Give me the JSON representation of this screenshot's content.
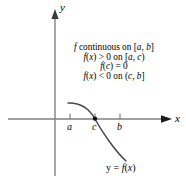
{
  "figure": {
    "title_alt": "Graph of a continuous function f on [a, b] crossing the x-axis at c",
    "background_color": "#ffffff",
    "axis_color": "#808080",
    "curve_color": "#59595b",
    "text_color": "#000000"
  },
  "axes": {
    "y_axis_label": "y",
    "x_axis_label": "x",
    "x_axis_y_pixel": 119,
    "y_axis_x_pixel": 55
  },
  "ticks": [
    {
      "label": "a",
      "x": 70
    },
    {
      "label": "c",
      "x": 95
    },
    {
      "label": "b",
      "x": 120
    }
  ],
  "conditions": {
    "lines": [
      "f continuous on [a, b]",
      "f(x) > 0 on [a, c)",
      "f(c) = 0",
      "f(x) < 0 on (c, b]"
    ],
    "line1": "f continuous on [a, b]",
    "line2": "f(x) > 0 on [a, c)",
    "line3": "f(c) = 0",
    "line4": "f(x) < 0 on (c, b]"
  },
  "curve": {
    "label": "y = f(x)",
    "root_point_x": 95,
    "root_point_y": 119,
    "start_point": [
      68,
      103
    ],
    "end_point": [
      126,
      161
    ]
  }
}
